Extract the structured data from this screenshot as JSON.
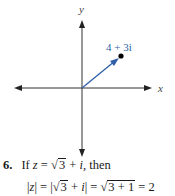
{
  "figure": {
    "axis_labels": {
      "x": "x",
      "y": "y"
    },
    "point_label": "4 + 3i",
    "vector_color": "#2f5fa8",
    "axis_color": "#333333",
    "point_color": "#000000"
  },
  "problem": {
    "number": "6.",
    "line1_prefix": "If ",
    "line1_var": "z",
    "line1_eq": " = ",
    "line1_sqrt_sym": "√",
    "line1_radicand": "3",
    "line1_rest": " + ",
    "line1_i": "i",
    "line1_tail": ", then",
    "line2_abs_open": "|",
    "line2_var": "z",
    "line2_abs_close": "|",
    "line2_eq1": " = |",
    "line2_sqrt_sym1": "√",
    "line2_radicand1": "3",
    "line2_plus": " + ",
    "line2_i": "i",
    "line2_eq2": "| = ",
    "line2_sqrt_sym2": "√",
    "line2_radicand2": "3 + 1",
    "line2_result": " = 2"
  }
}
